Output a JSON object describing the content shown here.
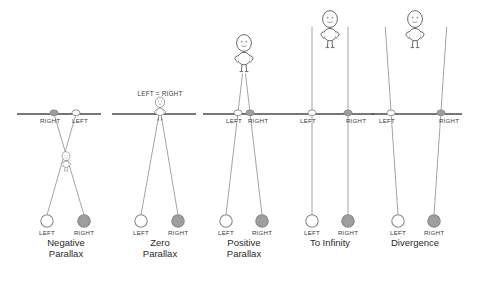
{
  "figure": {
    "colors": {
      "screen_line": "#4a4a4a",
      "ray_line": "#9a9a9a",
      "figure_outline": "#6b6b6b",
      "left_eye_fill": "#ffffff",
      "right_eye_fill": "#9e9e9e",
      "eye_outline": "#8a8a8a",
      "text": "#2b2b2b",
      "background": "#ffffff"
    },
    "screen_line_y": 114,
    "eye_row_y": 221,
    "labels": {
      "left": "LEFT",
      "right": "RIGHT",
      "left_equals_right": "LEFT = RIGHT"
    },
    "panels": [
      {
        "id": "negative-parallax",
        "caption": "Negative\nParallax",
        "caption_line1": "Negative",
        "caption_line2": "Parallax",
        "center_x": 66,
        "screen_x1": 17,
        "screen_x2": 101,
        "eye_left_x": 47,
        "eye_right_x": 84,
        "screen_left_img_x": 76,
        "screen_right_img_x": 54,
        "screen_left_img_label": "LEFT",
        "screen_right_img_label": "RIGHT",
        "object_x": 66,
        "object_y": 166,
        "object_scale": 0.52,
        "rays_cross": true
      },
      {
        "id": "zero-parallax",
        "caption": "Zero\nParallax",
        "caption_line1": "Zero",
        "caption_line2": "Parallax",
        "center_x": 160,
        "screen_x1": 112,
        "screen_x2": 196,
        "eye_left_x": 141,
        "eye_right_x": 178,
        "screen_left_img_x": 160,
        "screen_right_img_x": 160,
        "screen_left_img_label": "LEFT = RIGHT",
        "screen_right_img_label": "",
        "object_x": 160,
        "object_y": 114,
        "object_scale": 0.62,
        "rays_cross": false
      },
      {
        "id": "positive-parallax",
        "caption": "Positive\nParallax",
        "caption_line1": "Positive",
        "caption_line2": "Parallax",
        "center_x": 244,
        "screen_x1": 203,
        "screen_x2": 288,
        "eye_left_x": 226,
        "eye_right_x": 262,
        "screen_left_img_x": 238,
        "screen_right_img_x": 250,
        "screen_left_img_label": "LEFT",
        "screen_right_img_label": "RIGHT",
        "object_x": 244,
        "object_y": 62,
        "object_scale": 1.0,
        "rays_cross": false
      },
      {
        "id": "to-infinity",
        "caption": "To Infinity",
        "caption_line1": "To Infinity",
        "caption_line2": "",
        "center_x": 330,
        "screen_x1": 288,
        "screen_x2": 374,
        "eye_left_x": 312,
        "eye_right_x": 348,
        "screen_left_img_x": 312,
        "screen_right_img_x": 348,
        "screen_left_img_label": "LEFT",
        "screen_right_img_label": "RIGHT",
        "object_x": 330,
        "object_y": 38,
        "object_scale": 1.0,
        "rays_cross": false
      },
      {
        "id": "divergence",
        "caption": "Divergence",
        "caption_line1": "Divergence",
        "caption_line2": "",
        "center_x": 415,
        "screen_x1": 372,
        "screen_x2": 462,
        "eye_left_x": 398,
        "eye_right_x": 434,
        "screen_left_img_x": 391,
        "screen_right_img_x": 441,
        "screen_left_img_label": "LEFT",
        "screen_right_img_label": "RIGHT",
        "object_x": 415,
        "object_y": 38,
        "object_scale": 1.0,
        "rays_cross": false
      }
    ]
  }
}
